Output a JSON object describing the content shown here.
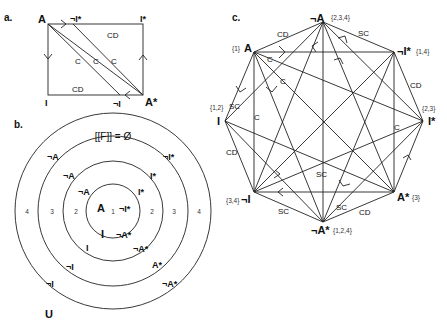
{
  "panels": {
    "a": {
      "label": "a.",
      "vertices": {
        "A": "A",
        "notIstar": "¬I*",
        "Istar": "I*",
        "I": "I",
        "notI": "¬I",
        "Astar": "A*"
      },
      "edge_labels": {
        "top": "CD",
        "bottom": "CD",
        "c1": "C",
        "c2": "C",
        "c3": "C"
      }
    },
    "b": {
      "label": "b.",
      "top_label": "[[F]] = Ø",
      "universe_label": "U",
      "ring_numbers": [
        "1",
        "2",
        "3",
        "4"
      ],
      "ring1": [
        "A",
        "¬I*",
        "I",
        "¬A*"
      ],
      "ring2": [
        "¬A",
        "I*",
        "I",
        "¬A*"
      ],
      "ring3": [
        "¬A",
        "I*",
        "¬I",
        "A*"
      ],
      "ring4": [
        "¬A",
        "¬I*",
        "¬I",
        "¬A*"
      ]
    },
    "c": {
      "label": "c.",
      "vertices": {
        "notA": {
          "name": "¬A",
          "set": "{2,3,4}"
        },
        "A": {
          "name": "A",
          "set": "{1}"
        },
        "notIstar": {
          "name": "¬I*",
          "set": "{1,4}"
        },
        "I": {
          "name": "I",
          "set": "{1,2}"
        },
        "Istar": {
          "name": "I*",
          "set": "{2,3}"
        },
        "notI": {
          "name": "¬I",
          "set": "{3,4}"
        },
        "Astar": {
          "name": "A*",
          "set": "{3}"
        },
        "notAstar": {
          "name": "¬A*",
          "set": "{1,2,4}"
        }
      },
      "edge_labels": [
        "CD",
        "SC",
        "CD",
        "SC",
        "C",
        "C",
        "C",
        "SC",
        "C",
        "CD",
        "SC",
        "SC",
        "CD"
      ]
    }
  }
}
